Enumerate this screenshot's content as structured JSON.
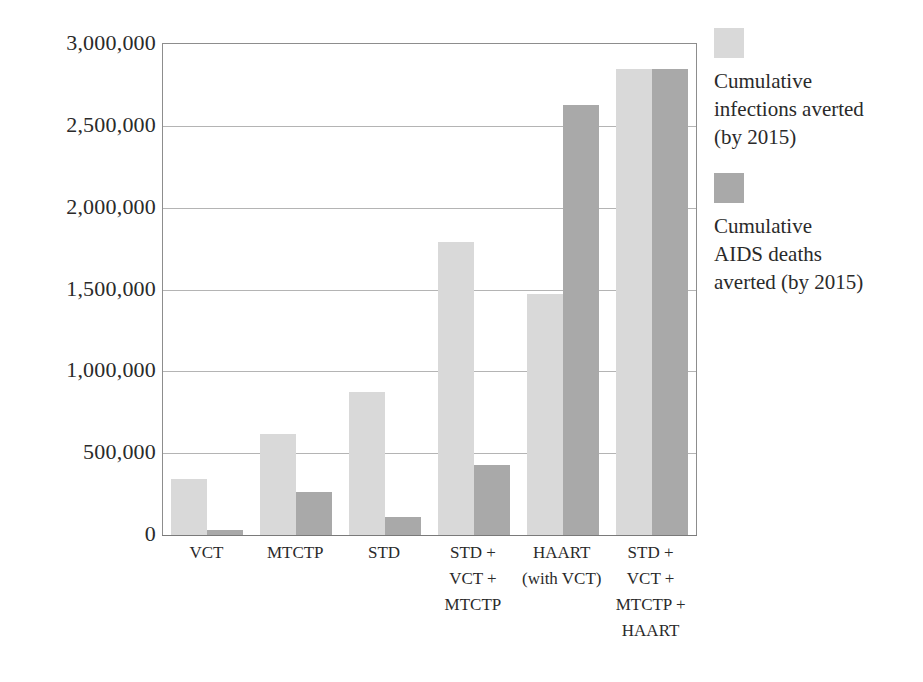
{
  "chart_data": {
    "type": "bar",
    "title": "",
    "xlabel": "",
    "ylabel": "",
    "ylim": [
      0,
      3000000
    ],
    "ytick_labels": [
      "3,000,000",
      "2,500,000",
      "2,000,000",
      "1,500,000",
      "1,000,000",
      "500,000",
      "0"
    ],
    "ytick_values": [
      3000000,
      2500000,
      2000000,
      1500000,
      1000000,
      500000,
      0
    ],
    "grid": true,
    "legend_position": "right",
    "categories": [
      "VCT",
      "MTCTP",
      "STD",
      "STD + VCT + MTCTP",
      "HAART (with VCT)",
      "STD + VCT + MTCTP + HAART"
    ],
    "category_lines": [
      [
        "VCT"
      ],
      [
        "MTCTP"
      ],
      [
        "STD"
      ],
      [
        "STD +",
        "VCT +",
        "MTCTP"
      ],
      [
        "HAART",
        "(with VCT)"
      ],
      [
        "STD +",
        "VCT +",
        "MTCTP +",
        "HAART"
      ]
    ],
    "series": [
      {
        "name": "Cumulative infections averted (by 2015)",
        "name_lines": [
          "Cumulative",
          "infections averted",
          "(by 2015)"
        ],
        "color": "#d9d9d9",
        "values": [
          340000,
          620000,
          875000,
          1790000,
          1470000,
          2850000
        ]
      },
      {
        "name": "Cumulative AIDS deaths averted (by 2015)",
        "name_lines": [
          "Cumulative",
          "AIDS deaths",
          "averted (by 2015)"
        ],
        "color": "#a9a9a9",
        "values": [
          30000,
          265000,
          110000,
          425000,
          2630000,
          2850000
        ]
      }
    ]
  },
  "colors": {
    "series_light": "#d9d9d9",
    "series_dark": "#a9a9a9",
    "gridline": "#b4b4b4",
    "axis": "#8d8d8d",
    "text": "#2a2a2a",
    "background": "#ffffff"
  }
}
